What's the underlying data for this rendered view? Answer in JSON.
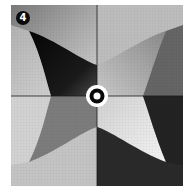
{
  "figure": {
    "panel_label": "4",
    "colors": {
      "background": "#ffffff",
      "dark": "#0a0a0a",
      "mid": "#8a8a8a",
      "light": "#e8e8e8",
      "axis": "#1a1a1a"
    }
  }
}
